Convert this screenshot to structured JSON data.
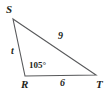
{
  "figure": {
    "kind": "triangle-diagram",
    "name": "triangle-RST",
    "background_color": "#ffffff",
    "stroke_color": "#58595b",
    "text_color": "#231f20",
    "stroke_width": 1,
    "canvas": {
      "width": 110,
      "height": 94
    },
    "vertices": [
      {
        "id": "S",
        "label": "S",
        "x": 13,
        "y": 19
      },
      {
        "id": "R",
        "label": "R",
        "x": 25,
        "y": 76
      },
      {
        "id": "T",
        "label": "T",
        "x": 96,
        "y": 75
      }
    ],
    "sides": [
      {
        "id": "ST",
        "from": "S",
        "to": "T",
        "label": "9"
      },
      {
        "id": "SR",
        "from": "S",
        "to": "R",
        "label": "t"
      },
      {
        "id": "RT",
        "from": "R",
        "to": "T",
        "label": "6"
      }
    ],
    "angles": [
      {
        "id": "R",
        "at": "R",
        "label": "105°"
      }
    ]
  }
}
